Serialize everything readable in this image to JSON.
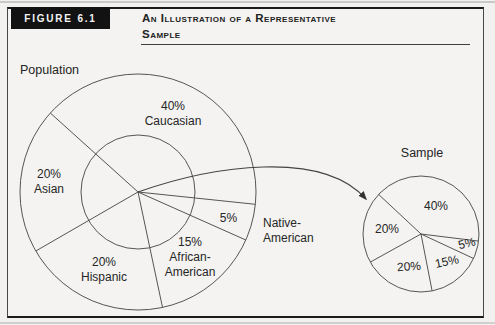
{
  "header": {
    "figure_tag": "FIGURE 6.1",
    "title_line1": "An Illustration of a Representative",
    "title_line2": "Sample"
  },
  "population_chart": {
    "title": "Population",
    "caucasian_pct": "40%",
    "caucasian_name": "Caucasian",
    "asian_pct": "20%",
    "asian_name": "Asian",
    "hispanic_pct": "20%",
    "hispanic_name": "Hispanic",
    "african_pct": "15%",
    "african_name_line1": "African-",
    "african_name_line2": "American",
    "native_pct": "5%",
    "native_name_line1": "Native-",
    "native_name_line2": "American"
  },
  "sample_chart": {
    "title": "Sample",
    "caucasian_pct": "40%",
    "asian_pct": "20%",
    "hispanic_pct": "20%",
    "african_pct": "15%",
    "native_pct": "5%"
  },
  "chart_data": [
    {
      "type": "pie",
      "title": "Population",
      "style": "donut-outline-with-center-lines",
      "direction": "counterclockwise",
      "start_angle_deg": -6,
      "categories": [
        "Caucasian",
        "Asian",
        "Hispanic",
        "African-American",
        "Native-American"
      ],
      "values": [
        40,
        20,
        20,
        15,
        5
      ],
      "unit": "percent",
      "inner_circle": true
    },
    {
      "type": "pie",
      "title": "Sample",
      "style": "outline-pie",
      "direction": "counterclockwise",
      "start_angle_deg": -7,
      "categories": [
        "Caucasian",
        "Asian",
        "Hispanic",
        "African-American",
        "Native-American"
      ],
      "values": [
        40,
        20,
        20,
        15,
        5
      ],
      "unit": "percent",
      "inner_circle": false
    }
  ],
  "annotation": {
    "arrow": "from Population pie center to Sample pie"
  }
}
